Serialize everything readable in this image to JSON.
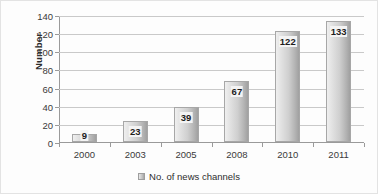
{
  "chart_data": {
    "type": "bar",
    "title": "",
    "xlabel": "",
    "ylabel": "Number",
    "categories": [
      "2000",
      "2003",
      "2005",
      "2008",
      "2010",
      "2011"
    ],
    "values": [
      9,
      23,
      39,
      67,
      122,
      133
    ],
    "series": [
      {
        "name": "No. of news channels",
        "values": [
          9,
          23,
          39,
          67,
          122,
          133
        ]
      }
    ],
    "ylim": [
      0,
      140
    ],
    "yticks": [
      0,
      20,
      40,
      60,
      80,
      100,
      120,
      140
    ],
    "ytick_labels": [
      "0",
      "20",
      "40",
      "60",
      "80",
      "100",
      "120",
      "140"
    ],
    "grid": true,
    "legend": {
      "position": "bottom",
      "entries": [
        "No. of news channels"
      ],
      "swatch_icon": "legend-swatch-icon"
    },
    "data_labels": [
      "9",
      "23",
      "39",
      "67",
      "122",
      "133"
    ],
    "colors": {
      "bar_light": "#efefef",
      "bar_dark": "#a0a0a0",
      "bar_border": "#a7a7a7",
      "gridline": "#c9c9c9",
      "axis": "#9a9a9a",
      "text": "#3a3a3a",
      "background": "#fdfdfd"
    }
  }
}
